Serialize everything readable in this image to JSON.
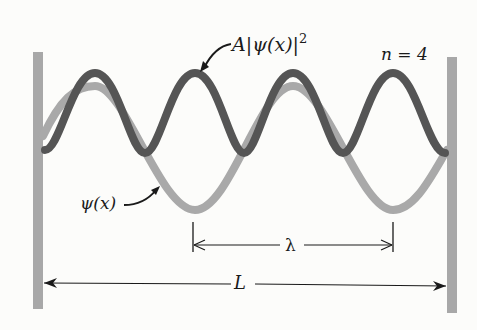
{
  "diagram": {
    "labels": {
      "prob_density": "A|ψ(x)|",
      "prob_density_exp": "2",
      "prob_A": "A",
      "prob_bar_open": "|",
      "prob_psi": "ψ(x)",
      "prob_bar_close": "|",
      "quantum_number": "n = 4",
      "wavefunction": "ψ(x)",
      "wavelength": "λ",
      "length": "L"
    },
    "colors": {
      "wall": "#a8a8a8",
      "psi_curve": "#a9a9a9",
      "density_curve": "#555555",
      "arrows": "#1a1a1a",
      "background": "#fcfcfa"
    },
    "geometry": {
      "left_wall_x": 38,
      "right_wall_x": 452,
      "baseline_y": 153,
      "n": 4,
      "wavelength_span": [
        193,
        393
      ],
      "length_span": [
        43,
        447
      ]
    }
  }
}
